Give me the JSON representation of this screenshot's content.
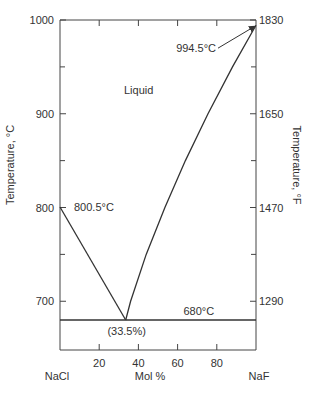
{
  "chart_data": {
    "type": "line",
    "title": "",
    "xlabel": "Mol %",
    "ylabel": "Temperature, °C",
    "ylabel_right": "Temperature, °F",
    "x_end_labels": {
      "left": "NaCl",
      "right": "NaF"
    },
    "xlim": [
      0,
      100
    ],
    "ylim": [
      648,
      1000
    ],
    "x_ticks": [
      20,
      40,
      60,
      80
    ],
    "y_ticks": [
      700,
      800,
      900,
      1000
    ],
    "y_minor_ticks": [
      750,
      850,
      950
    ],
    "y_right_ticks": [
      {
        "label": "1290",
        "celsius": 700
      },
      {
        "label": "1470",
        "celsius": 800
      },
      {
        "label": "1650",
        "celsius": 900
      },
      {
        "label": "1830",
        "celsius": 1000
      }
    ],
    "y_right_minor_ticks": [
      750,
      850,
      950
    ],
    "grid": false,
    "legend": "none",
    "series": [
      {
        "name": "liquidus-nacl-side",
        "x": [
          0,
          33.5
        ],
        "y": [
          800.5,
          680
        ]
      },
      {
        "name": "liquidus-naf-side",
        "x": [
          33.5,
          36,
          44,
          53.5,
          64,
          75.5,
          88,
          100
        ],
        "y": [
          680,
          700,
          750,
          800,
          850,
          900,
          950,
          994.5
        ]
      },
      {
        "name": "eutectic-line",
        "x": [
          0,
          100
        ],
        "y": [
          680,
          680
        ]
      }
    ],
    "annotations": [
      {
        "text": "Liquid",
        "x": 34,
        "y": 925
      },
      {
        "text": "994.5°C",
        "x": 100,
        "y": 994.5,
        "arrow": true
      },
      {
        "text": "800.5°C",
        "x": 0,
        "y": 800.5
      },
      {
        "text": "680°C",
        "x": 80,
        "y": 680
      },
      {
        "text": "(33.5%)",
        "x": 33.5,
        "y": 680
      }
    ]
  }
}
